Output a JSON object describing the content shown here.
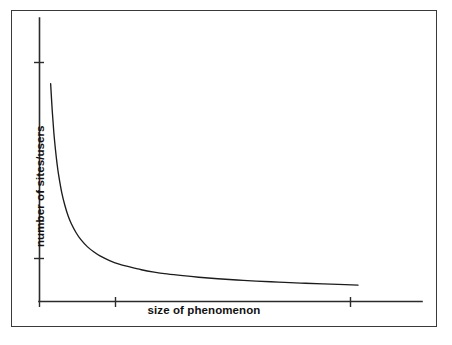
{
  "chart_data": {
    "type": "line",
    "title": "",
    "subtitle": "",
    "xlabel": "size of phenomenon",
    "ylabel": "number of sites/users",
    "legend": [],
    "annotations": [],
    "grid": false,
    "legend_position": "none",
    "axis_tick_labels": {
      "x": [],
      "y": []
    },
    "axis_ranges": {
      "xlim": [
        0,
        100
      ],
      "ylim": [
        0,
        100
      ]
    },
    "series": [
      {
        "name": "power-law distribution",
        "color": "#1c1c1c",
        "x": [
          3.5,
          4.0,
          4.5,
          5.0,
          5.5,
          6.0,
          7.0,
          8.0,
          9.0,
          10.0,
          11.5,
          13.0,
          15.0,
          17.0,
          19.0,
          22.0,
          25.0,
          28.0,
          32.0,
          36.0,
          40.0,
          45.0,
          50.0,
          56.0,
          62.0,
          68.0,
          75.0,
          82.0,
          89.0,
          96.0,
          100.0
        ],
        "y": [
          83.0,
          72.5,
          64.0,
          57.5,
          52.0,
          47.5,
          40.5,
          35.5,
          31.5,
          28.5,
          25.0,
          22.3,
          19.6,
          17.6,
          16.0,
          14.2,
          12.8,
          11.8,
          10.6,
          9.7,
          9.0,
          8.3,
          7.7,
          7.1,
          6.6,
          6.2,
          5.8,
          5.4,
          5.1,
          4.8,
          4.6
        ]
      }
    ]
  },
  "axes": {
    "y_ticks_pixel": [
      62,
      258
    ],
    "x_ticks_pixel": [
      115,
      350
    ]
  }
}
